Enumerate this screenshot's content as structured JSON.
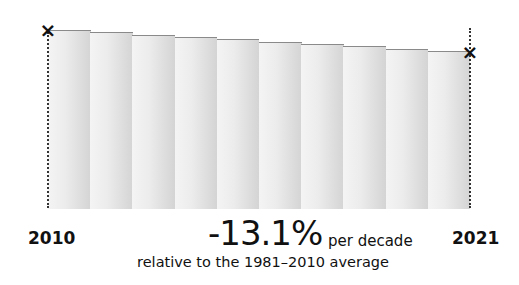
{
  "chart_data": {
    "type": "bar",
    "title": "",
    "categories": [
      "2011",
      "2012",
      "2013",
      "2014",
      "2015",
      "2016",
      "2017",
      "2018",
      "2019",
      "2020"
    ],
    "values": [
      100,
      98.7,
      97.4,
      96.1,
      94.8,
      93.5,
      92.2,
      90.9,
      89.6,
      88.3
    ],
    "xlabel": "",
    "ylabel": "",
    "start_label": "2010",
    "end_label": "2021",
    "trend": "-13.1%",
    "trend_unit": "per decade",
    "annotation": "relative to the 1981–2010 average",
    "grid": false,
    "legend": "none"
  },
  "labels": {
    "start_year": "2010",
    "end_year": "2021",
    "trend_value": "-13.1%",
    "trend_unit": "per decade",
    "reference": "relative to the 1981–2010 average"
  },
  "markers": {
    "start": "×",
    "end": "×"
  }
}
